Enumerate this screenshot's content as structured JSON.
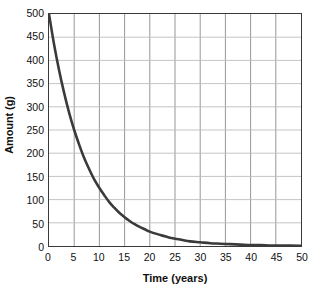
{
  "chart_data": {
    "type": "line",
    "title": "",
    "xlabel": "Time (years)",
    "ylabel": "Amount (g)",
    "xlim": [
      0,
      50
    ],
    "ylim": [
      0,
      500
    ],
    "grid": true,
    "legend": null,
    "xticks": [
      0,
      5,
      10,
      15,
      20,
      25,
      30,
      35,
      40,
      45,
      50
    ],
    "xtick_labels": [
      "0",
      "5",
      "10",
      "15",
      "20",
      "25",
      "30",
      "35",
      "40",
      "45",
      "50"
    ],
    "yticks": [
      0,
      50,
      100,
      150,
      200,
      250,
      300,
      350,
      400,
      450,
      500
    ],
    "ytick_labels": [
      "0",
      "50",
      "100",
      "150",
      "200",
      "250",
      "300",
      "350",
      "400",
      "450",
      "500"
    ],
    "series": [
      {
        "name": "Amount remaining",
        "color": "#3a3a3a",
        "initial_value": 500,
        "half_life_years": 5,
        "x": [
          0,
          1,
          2,
          3,
          4,
          5,
          6,
          7,
          8,
          9,
          10,
          11,
          12,
          13,
          14,
          15,
          16,
          17,
          18,
          19,
          20,
          22,
          24,
          26,
          28,
          30,
          32,
          34,
          36,
          38,
          40,
          42,
          44,
          46,
          48,
          50
        ],
        "values": [
          500,
          435,
          379,
          330,
          287,
          250,
          218,
          189,
          165,
          143,
          125,
          109,
          94,
          82,
          71,
          62,
          54,
          47,
          41,
          36,
          31,
          24,
          18,
          14,
          10,
          8,
          6,
          5,
          4,
          3,
          2,
          2,
          1,
          1,
          1,
          0.5
        ]
      }
    ]
  },
  "axes": {
    "x_title": "Time (years)",
    "y_title": "Amount (g)"
  },
  "colors": {
    "curve": "#3a3a3a",
    "frame": "#3a3a3a",
    "grid_vertical": "#8a8a8a",
    "grid_horizontal": "#bdbdbd",
    "text": "#111111",
    "background": "#ffffff"
  }
}
